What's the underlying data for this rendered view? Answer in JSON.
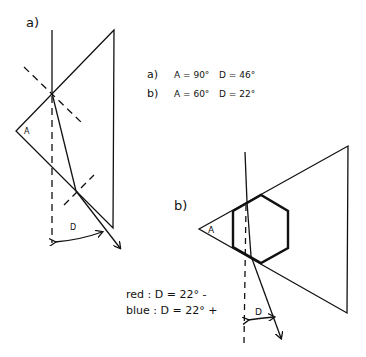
{
  "panel_a": {
    "label": "a)",
    "angle_label": "A",
    "deviation_label": "D"
  },
  "panel_b": {
    "label": "b)",
    "angle_label": "A",
    "deviation_label": "D"
  },
  "legend_values": {
    "a": {
      "label": "a)",
      "A": "A = 90°",
      "D": "D = 46°"
    },
    "b": {
      "label": "b)",
      "A": "A = 60°",
      "D": "D = 22°"
    }
  },
  "color_notes": {
    "red": "red :  D = 22° -",
    "blue": "blue :  D = 22° +"
  },
  "colors": {
    "ink": "#111111",
    "background": "#ffffff"
  }
}
